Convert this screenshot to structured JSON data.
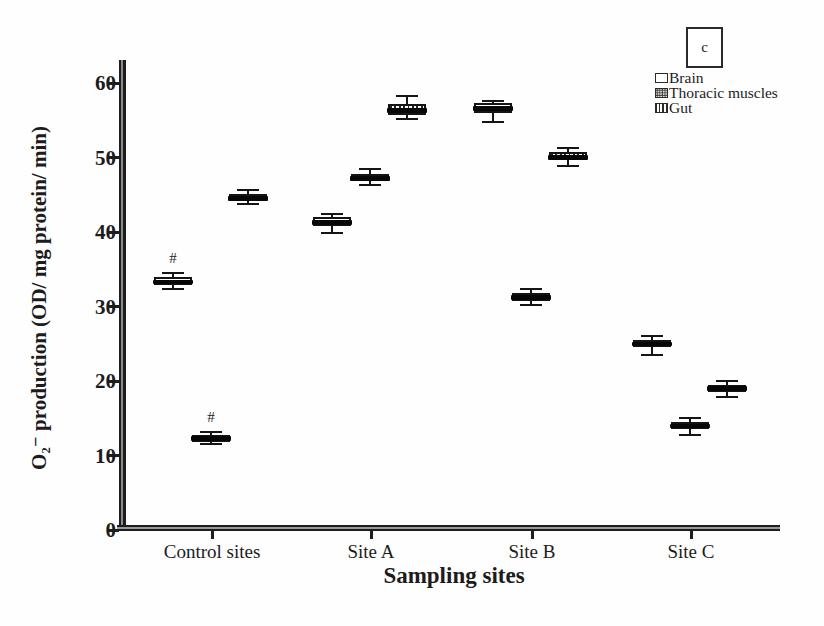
{
  "figure": {
    "panel_letter": "c",
    "background": "#fefefe",
    "ink_color": "#1c1c1c"
  },
  "y_axis": {
    "label": "O₂⁻ production (OD/ mg protein/ min)",
    "ticks": [
      0,
      10,
      20,
      30,
      40,
      50,
      60
    ],
    "range": [
      0,
      63
    ]
  },
  "x_axis": {
    "label": "Sampling sites",
    "categories": [
      "Control sites",
      "Site A",
      "Site B",
      "Site C"
    ]
  },
  "legend": {
    "items": [
      {
        "label": "Brain",
        "pattern": "plain"
      },
      {
        "label": "Thoracic muscles",
        "pattern": "dots"
      },
      {
        "label": "Gut",
        "pattern": "vlines"
      }
    ]
  },
  "chart_data": {
    "type": "box",
    "title": "",
    "xlabel": "Sampling sites",
    "ylabel": "O2- production (OD/ mg protein/ min)",
    "ylim": [
      0,
      63
    ],
    "grid": false,
    "legend_position": "top-right",
    "categories": [
      "Control sites",
      "Site A",
      "Site B",
      "Site C"
    ],
    "series": [
      {
        "name": "Brain",
        "pattern": "plain",
        "boxes": [
          {
            "low": 32.3,
            "q1": 32.9,
            "median": 33.3,
            "q3": 33.9,
            "high": 34.5,
            "note": "#"
          },
          {
            "low": 39.9,
            "q1": 40.8,
            "median": 41.3,
            "q3": 42.0,
            "high": 42.4
          },
          {
            "low": 54.8,
            "q1": 56.0,
            "median": 56.6,
            "q3": 57.3,
            "high": 57.6
          },
          {
            "low": 23.5,
            "q1": 24.5,
            "median": 25.0,
            "q3": 25.5,
            "high": 26.1
          }
        ]
      },
      {
        "name": "Thoracic muscles",
        "pattern": "dots",
        "boxes": [
          {
            "low": 11.5,
            "q1": 12.0,
            "median": 12.3,
            "q3": 12.7,
            "high": 13.1,
            "note": "#"
          },
          {
            "low": 46.3,
            "q1": 46.8,
            "median": 47.2,
            "q3": 47.8,
            "high": 48.4
          },
          {
            "low": 30.2,
            "q1": 30.8,
            "median": 31.2,
            "q3": 31.8,
            "high": 32.4
          },
          {
            "low": 12.7,
            "q1": 13.5,
            "median": 14.0,
            "q3": 14.5,
            "high": 15.1
          }
        ]
      },
      {
        "name": "Gut",
        "pattern": "vlines",
        "boxes": [
          {
            "low": 43.7,
            "q1": 44.2,
            "median": 44.5,
            "q3": 45.1,
            "high": 45.7
          },
          {
            "low": 55.2,
            "q1": 55.7,
            "median": 56.3,
            "q3": 57.2,
            "high": 58.3
          },
          {
            "low": 48.9,
            "q1": 49.6,
            "median": 50.0,
            "q3": 50.7,
            "high": 51.3
          },
          {
            "low": 17.8,
            "q1": 18.6,
            "median": 19.0,
            "q3": 19.5,
            "high": 20.0
          }
        ]
      }
    ],
    "annotations": [
      {
        "text": "#",
        "target": "Control sites / Brain"
      },
      {
        "text": "#",
        "target": "Control sites / Thoracic muscles"
      }
    ]
  }
}
